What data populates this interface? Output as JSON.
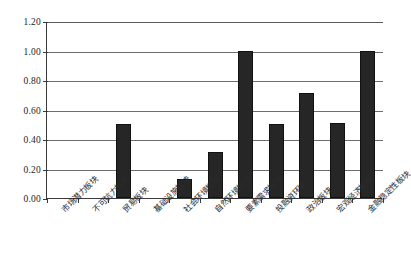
{
  "chart_data": {
    "type": "bar",
    "title": "",
    "subtitle": "",
    "xlabel": "",
    "ylabel": "",
    "ylim": [
      0.0,
      1.2
    ],
    "ytick_labels": [
      "0.00",
      "0.20",
      "0.40",
      "0.60",
      "0.80",
      "1.00",
      "1.20"
    ],
    "ytick_values": [
      0.0,
      0.2,
      0.4,
      0.6,
      0.8,
      1.0,
      1.2
    ],
    "grid": true,
    "legend": "none",
    "categories": [
      "市场潜力板块",
      "不可抗力板块",
      "贸易板块",
      "基础设施板块",
      "社会环境板块",
      "自然环境板块",
      "要素需求板块",
      "投融资环境",
      "政治板块",
      "宏观经济板块",
      "金融稳定性板块"
    ],
    "values": [
      0.0,
      0.0,
      0.5,
      0.0,
      0.13,
      0.31,
      1.0,
      0.5,
      0.71,
      0.51,
      1.0
    ],
    "bar_color": "#262626"
  }
}
